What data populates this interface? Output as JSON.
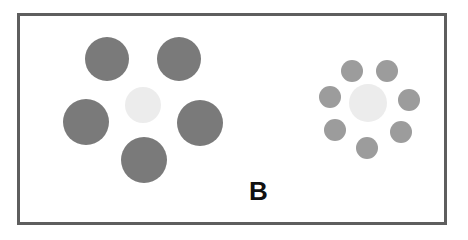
{
  "figure": {
    "label": "B",
    "border_color": "#5e5e5e",
    "left_cluster": {
      "center": {
        "x": 143,
        "y": 105,
        "r": 18,
        "color": "#ececec"
      },
      "surround_color": "#7a7a7a",
      "surround": [
        {
          "x": 107,
          "y": 59,
          "r": 22
        },
        {
          "x": 179,
          "y": 59,
          "r": 22
        },
        {
          "x": 86,
          "y": 122,
          "r": 23
        },
        {
          "x": 200,
          "y": 123,
          "r": 23
        },
        {
          "x": 144,
          "y": 160,
          "r": 23
        }
      ]
    },
    "right_cluster": {
      "center": {
        "x": 368,
        "y": 103,
        "r": 19,
        "color": "#ececec"
      },
      "surround_color": "#9c9c9c",
      "surround": [
        {
          "x": 352,
          "y": 71,
          "r": 11
        },
        {
          "x": 387,
          "y": 71,
          "r": 11
        },
        {
          "x": 330,
          "y": 97,
          "r": 11
        },
        {
          "x": 409,
          "y": 100,
          "r": 11
        },
        {
          "x": 335,
          "y": 130,
          "r": 11
        },
        {
          "x": 401,
          "y": 132,
          "r": 11
        },
        {
          "x": 367,
          "y": 148,
          "r": 11
        }
      ]
    }
  }
}
